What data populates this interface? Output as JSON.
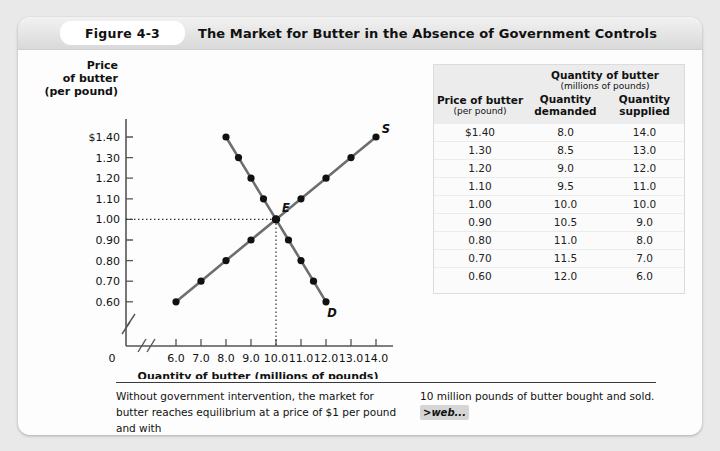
{
  "figure": {
    "number_label": "Figure 4-3",
    "title": "The Market for Butter in the Absence of Government Controls"
  },
  "chart_data": {
    "type": "line",
    "title": "",
    "xlabel": "Quantity of butter (millions of pounds)",
    "ylabel_lines": [
      "Price",
      "of butter",
      "(per pound)"
    ],
    "xlim": [
      6.0,
      14.0
    ],
    "ylim": [
      0.6,
      1.4
    ],
    "grid": false,
    "axis_break": true,
    "x_ticks": [
      "6.0",
      "7.0",
      "8.0",
      "9.0",
      "10.0",
      "11.0",
      "12.0",
      "13.0",
      "14.0"
    ],
    "y_ticks": [
      "$1.40",
      "1.30",
      "1.20",
      "1.10",
      "1.00",
      "0.90",
      "0.80",
      "0.70",
      "0.60"
    ],
    "origin_label": "0",
    "series": [
      {
        "name": "Demand",
        "label": "D",
        "x": [
          8.0,
          8.5,
          9.0,
          9.5,
          10.0,
          10.5,
          11.0,
          11.5,
          12.0
        ],
        "y": [
          1.4,
          1.3,
          1.2,
          1.1,
          1.0,
          0.9,
          0.8,
          0.7,
          0.6
        ]
      },
      {
        "name": "Supply",
        "label": "S",
        "x": [
          6.0,
          7.0,
          8.0,
          9.0,
          10.0,
          11.0,
          12.0,
          13.0,
          14.0
        ],
        "y": [
          0.6,
          0.7,
          0.8,
          0.9,
          1.0,
          1.1,
          1.2,
          1.3,
          1.4
        ]
      }
    ],
    "equilibrium": {
      "label": "E",
      "x": 10.0,
      "y": 1.0
    }
  },
  "table": {
    "span_header": "Quantity of butter",
    "span_subheader": "(millions of pounds)",
    "columns": [
      {
        "line1": "Price of butter",
        "line2": "(per pound)"
      },
      {
        "line1": "Quantity",
        "line2": "demanded"
      },
      {
        "line1": "Quantity",
        "line2": "supplied"
      }
    ],
    "rows": [
      [
        "$1.40",
        "8.0",
        "14.0"
      ],
      [
        "1.30",
        "8.5",
        "13.0"
      ],
      [
        "1.20",
        "9.0",
        "12.0"
      ],
      [
        "1.10",
        "9.5",
        "11.0"
      ],
      [
        "1.00",
        "10.0",
        "10.0"
      ],
      [
        "0.90",
        "10.5",
        "9.0"
      ],
      [
        "0.80",
        "11.0",
        "8.0"
      ],
      [
        "0.70",
        "11.5",
        "7.0"
      ],
      [
        "0.60",
        "12.0",
        "6.0"
      ]
    ]
  },
  "caption": {
    "column1": "Without government intervention, the market for butter reaches equilibrium at a price of $1 per pound and with",
    "column2": "10 million pounds of butter bought and sold.",
    "web_link": ">web..."
  },
  "colors": {
    "curve": "#6e6e6e",
    "point": "#111111",
    "axis": "#555555",
    "card": "#fdfdfd",
    "header_band": "#e6e6e6"
  }
}
